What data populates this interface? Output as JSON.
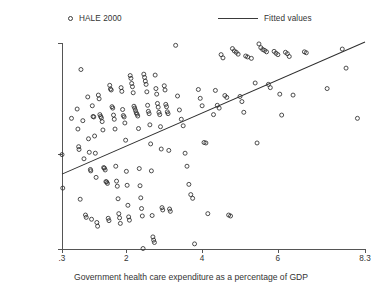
{
  "legend": {
    "entries": [
      {
        "label": "HALE 2000",
        "marker": "circle-marker-icon"
      },
      {
        "label": "Fitted values",
        "marker": "line-marker-icon"
      }
    ]
  },
  "axes": {
    "ylabel": "HALE 2000",
    "xlabel": "Government health care expenditure as a percentage of GDP",
    "yticklabels": [
      "29.5",
      "50",
      "73.8"
    ],
    "xticklabels": [
      ".3",
      "2",
      "4",
      "6",
      "8.3"
    ]
  },
  "colors": {
    "marker": "#2e2e2e",
    "line": "#2e2e2e",
    "axis": "#555555",
    "text": "#333333",
    "background": "#ffffff"
  },
  "chart_data": {
    "type": "scatter",
    "title": "",
    "xlabel": "Government health care expenditure as a percentage of GDP",
    "ylabel": "HALE 2000",
    "xlim": [
      0.3,
      8.3
    ],
    "ylim": [
      29.5,
      73.8
    ],
    "xticks": [
      0.3,
      2,
      4,
      6,
      8.3
    ],
    "yticks": [
      29.5,
      50,
      73.8
    ],
    "grid": false,
    "legend_position": "above-plot",
    "series": [
      {
        "name": "HALE 2000",
        "marker": "open-circle",
        "points": [
          [
            0.3,
            49.8
          ],
          [
            0.32,
            42.6
          ],
          [
            0.55,
            57.6
          ],
          [
            0.7,
            59.6
          ],
          [
            0.72,
            55.3
          ],
          [
            0.74,
            51.5
          ],
          [
            0.75,
            50.9
          ],
          [
            0.78,
            40.2
          ],
          [
            0.8,
            68.1
          ],
          [
            0.85,
            57.1
          ],
          [
            0.88,
            48.9
          ],
          [
            0.92,
            36.8
          ],
          [
            0.94,
            36.3
          ],
          [
            0.98,
            62.2
          ],
          [
            1.0,
            53.2
          ],
          [
            1.02,
            50.3
          ],
          [
            1.05,
            46.6
          ],
          [
            1.06,
            46.3
          ],
          [
            1.08,
            35.9
          ],
          [
            1.1,
            60.3
          ],
          [
            1.12,
            58.0
          ],
          [
            1.14,
            57.9
          ],
          [
            1.16,
            53.8
          ],
          [
            1.18,
            50.1
          ],
          [
            1.2,
            44.9
          ],
          [
            1.22,
            35.2
          ],
          [
            1.24,
            34.4
          ],
          [
            1.26,
            62.6
          ],
          [
            1.28,
            61.8
          ],
          [
            1.3,
            58.4
          ],
          [
            1.32,
            58.0
          ],
          [
            1.34,
            57.7
          ],
          [
            1.36,
            56.9
          ],
          [
            1.38,
            55.1
          ],
          [
            1.4,
            47.0
          ],
          [
            1.42,
            46.9
          ],
          [
            1.44,
            46.5
          ],
          [
            1.46,
            44.0
          ],
          [
            1.48,
            43.9
          ],
          [
            1.5,
            43.6
          ],
          [
            1.52,
            36.1
          ],
          [
            1.54,
            35.6
          ],
          [
            1.56,
            64.7
          ],
          [
            1.58,
            63.9
          ],
          [
            1.6,
            63.7
          ],
          [
            1.62,
            60.1
          ],
          [
            1.64,
            59.8
          ],
          [
            1.66,
            58.3
          ],
          [
            1.68,
            57.4
          ],
          [
            1.7,
            55.3
          ],
          [
            1.72,
            47.3
          ],
          [
            1.74,
            44.1
          ],
          [
            1.76,
            43.0
          ],
          [
            1.78,
            40.3
          ],
          [
            1.8,
            37.1
          ],
          [
            1.82,
            36.2
          ],
          [
            1.84,
            35.0
          ],
          [
            1.86,
            64.2
          ],
          [
            1.88,
            63.4
          ],
          [
            1.9,
            59.5
          ],
          [
            1.92,
            58.2
          ],
          [
            1.94,
            57.9
          ],
          [
            1.96,
            56.6
          ],
          [
            1.98,
            52.9
          ],
          [
            2.0,
            46.2
          ],
          [
            2.02,
            43.2
          ],
          [
            2.04,
            38.9
          ],
          [
            2.06,
            36.4
          ],
          [
            2.08,
            35.7
          ],
          [
            2.1,
            66.8
          ],
          [
            2.12,
            66.2
          ],
          [
            2.14,
            65.1
          ],
          [
            2.16,
            64.4
          ],
          [
            2.18,
            63.1
          ],
          [
            2.2,
            60.2
          ],
          [
            2.22,
            59.8
          ],
          [
            2.24,
            59.3
          ],
          [
            2.26,
            58.8
          ],
          [
            2.28,
            58.5
          ],
          [
            2.3,
            58.1
          ],
          [
            2.32,
            55.4
          ],
          [
            2.34,
            46.8
          ],
          [
            2.36,
            43.1
          ],
          [
            2.38,
            40.5
          ],
          [
            2.4,
            38.2
          ],
          [
            2.42,
            36.6
          ],
          [
            2.44,
            29.6
          ],
          [
            2.46,
            67.1
          ],
          [
            2.48,
            66.4
          ],
          [
            2.5,
            65.6
          ],
          [
            2.52,
            64.9
          ],
          [
            2.54,
            63.3
          ],
          [
            2.56,
            60.4
          ],
          [
            2.58,
            59.1
          ],
          [
            2.6,
            58.6
          ],
          [
            2.62,
            56.2
          ],
          [
            2.64,
            52.1
          ],
          [
            2.66,
            46.3
          ],
          [
            2.68,
            36.7
          ],
          [
            2.7,
            32.1
          ],
          [
            2.72,
            31.4
          ],
          [
            2.74,
            30.9
          ],
          [
            2.76,
            66.9
          ],
          [
            2.78,
            64.0
          ],
          [
            2.8,
            62.8
          ],
          [
            2.82,
            60.8
          ],
          [
            2.84,
            60.0
          ],
          [
            2.86,
            58.9
          ],
          [
            2.88,
            58.4
          ],
          [
            2.9,
            55.8
          ],
          [
            2.92,
            51.0
          ],
          [
            2.94,
            38.4
          ],
          [
            2.96,
            37.9
          ],
          [
            3.0,
            64.6
          ],
          [
            3.02,
            63.7
          ],
          [
            3.04,
            60.6
          ],
          [
            3.06,
            60.1
          ],
          [
            3.08,
            59.0
          ],
          [
            3.1,
            58.6
          ],
          [
            3.12,
            50.7
          ],
          [
            3.14,
            38.1
          ],
          [
            3.16,
            37.6
          ],
          [
            3.3,
            73.3
          ],
          [
            3.35,
            62.4
          ],
          [
            3.4,
            59.4
          ],
          [
            3.45,
            57.4
          ],
          [
            3.5,
            56.0
          ],
          [
            3.55,
            50.1
          ],
          [
            3.6,
            47.3
          ],
          [
            3.65,
            43.4
          ],
          [
            3.7,
            41.2
          ],
          [
            3.75,
            40.4
          ],
          [
            3.8,
            30.6
          ],
          [
            3.9,
            63.8
          ],
          [
            3.95,
            61.9
          ],
          [
            4.0,
            60.3
          ],
          [
            4.05,
            52.4
          ],
          [
            4.1,
            52.3
          ],
          [
            4.15,
            37.1
          ],
          [
            4.3,
            58.4
          ],
          [
            4.35,
            63.6
          ],
          [
            4.4,
            60.4
          ],
          [
            4.45,
            59.8
          ],
          [
            4.5,
            71.3
          ],
          [
            4.55,
            70.6
          ],
          [
            4.6,
            62.5
          ],
          [
            4.65,
            62.1
          ],
          [
            4.7,
            36.8
          ],
          [
            4.75,
            36.6
          ],
          [
            4.8,
            72.6
          ],
          [
            4.85,
            72.1
          ],
          [
            4.9,
            71.8
          ],
          [
            4.95,
            71.4
          ],
          [
            5.0,
            62.3
          ],
          [
            5.05,
            61.2
          ],
          [
            5.1,
            58.9
          ],
          [
            5.15,
            71.0
          ],
          [
            5.2,
            70.8
          ],
          [
            5.3,
            70.5
          ],
          [
            5.4,
            65.2
          ],
          [
            5.45,
            52.3
          ],
          [
            5.5,
            73.6
          ],
          [
            5.55,
            72.8
          ],
          [
            5.6,
            72.4
          ],
          [
            5.65,
            72.2
          ],
          [
            5.7,
            71.9
          ],
          [
            5.75,
            64.9
          ],
          [
            5.8,
            64.2
          ],
          [
            5.9,
            72.0
          ],
          [
            5.95,
            71.6
          ],
          [
            6.0,
            71.3
          ],
          [
            6.05,
            62.8
          ],
          [
            6.1,
            58.3
          ],
          [
            6.2,
            71.8
          ],
          [
            6.25,
            71.5
          ],
          [
            6.3,
            70.9
          ],
          [
            6.4,
            62.6
          ],
          [
            6.7,
            71.9
          ],
          [
            6.75,
            71.7
          ],
          [
            7.3,
            64.0
          ],
          [
            7.7,
            72.5
          ],
          [
            7.8,
            68.4
          ],
          [
            8.1,
            57.6
          ]
        ]
      }
    ],
    "fit_line": {
      "name": "Fitted values",
      "x0": 0.3,
      "y0": 45.6,
      "x1": 8.3,
      "y1": 74.0
    }
  }
}
